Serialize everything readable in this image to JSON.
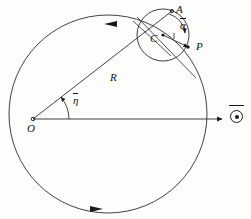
{
  "figure": {
    "background_color": "#fdfdfc",
    "stroke_color": "#1a1a1a",
    "labels": {
      "point_A": "A",
      "point_C": "C",
      "point_P": "P",
      "point_O": "O",
      "radius_R": "R",
      "angle_alpha": "α",
      "angle_eta": "η",
      "omega_vector": "⊙"
    },
    "geometry": {
      "large_circle": {
        "cx": 108,
        "cy": 114,
        "r": 99,
        "label": "deferent-circle"
      },
      "small_circle": {
        "cx": 163,
        "cy": 35,
        "r": 26,
        "label": "epicycle"
      },
      "origin": {
        "x": 33,
        "y": 119,
        "label": "O"
      },
      "epicycle_center": {
        "x": 163,
        "y": 35,
        "label": "C"
      },
      "point_A": {
        "x": 172,
        "y": 11,
        "label": "A"
      },
      "point_P": {
        "x": 188,
        "y": 47,
        "label": "P"
      },
      "axis_end": {
        "x": 222,
        "y": 119,
        "label": "horizontal-reference-axis"
      },
      "angle_eta_deg": 31,
      "angle_alpha_deg": 52,
      "rotation_sense": "counterclockwise"
    },
    "arrows": [
      {
        "name": "deferent-direction-top",
        "position": "top-of-large-circle",
        "direction": "counterclockwise"
      },
      {
        "name": "deferent-direction-bottom",
        "position": "bottom-of-large-circle",
        "direction": "counterclockwise"
      },
      {
        "name": "omega-axis-arrow",
        "position": "right-end-of-horizontal-axis",
        "direction": "right"
      },
      {
        "name": "alpha-angle-arrow",
        "position": "epicycle-angle-arc",
        "direction": "down"
      },
      {
        "name": "radius-to-P-arrow",
        "position": "C-to-P",
        "direction": "outward"
      }
    ]
  }
}
